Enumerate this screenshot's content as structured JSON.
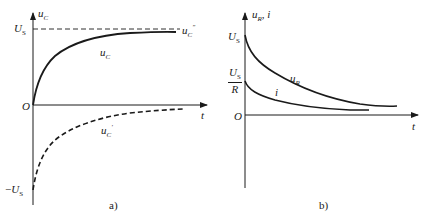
{
  "figure_a": {
    "caption": "a)",
    "y_axis_label": {
      "base": "u",
      "sub": "C"
    },
    "x_axis_label": "t",
    "origin_label": "O",
    "pos_tick": {
      "base": "U",
      "sub": "S"
    },
    "neg_tick": {
      "prefix": "−",
      "base": "U",
      "sub": "S"
    },
    "curves": [
      {
        "name": "u_C",
        "style": "solid",
        "label": {
          "base": "u",
          "sub": "C"
        }
      },
      {
        "name": "u_C_steady",
        "style": "dashed",
        "label": {
          "base": "u",
          "sub": "C",
          "sup": "″"
        }
      },
      {
        "name": "u_C_transient",
        "style": "dashed",
        "label": {
          "base": "u",
          "sub": "C",
          "sup": "′"
        }
      }
    ]
  },
  "figure_b": {
    "caption": "b)",
    "y_axis_label": {
      "base": "u",
      "sub": "R",
      "tail": ", i"
    },
    "x_axis_label": "t",
    "origin_label": "O",
    "tick_us": {
      "base": "U",
      "sub": "S"
    },
    "tick_us_over_r": {
      "num_base": "U",
      "num_sub": "S",
      "den": "R"
    },
    "curves": [
      {
        "name": "u_R",
        "style": "solid",
        "label": {
          "base": "u",
          "sub": "R"
        }
      },
      {
        "name": "i",
        "style": "solid",
        "label": {
          "base": "i"
        }
      }
    ]
  },
  "colors": {
    "ink": "#1a1a1a",
    "background": "#ffffff"
  }
}
